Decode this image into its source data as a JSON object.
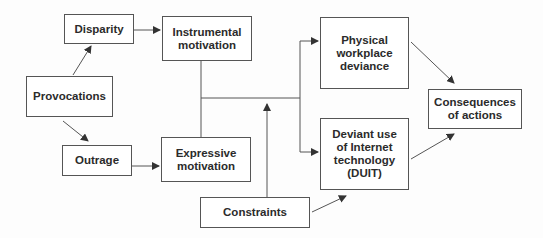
{
  "diagram": {
    "type": "flowchart",
    "colors": {
      "line": "#555555",
      "text": "#2b2b2b",
      "box_fill": "#ffffff"
    },
    "nodes": {
      "disparity": {
        "label": "Disparity"
      },
      "provocations": {
        "label": "Provocations"
      },
      "outrage": {
        "label": "Outrage"
      },
      "instrumental": {
        "label": "Instrumental motivation"
      },
      "expressive": {
        "label": "Expressive motivation"
      },
      "physical": {
        "label": "Physical workplace deviance"
      },
      "duit": {
        "label": "Deviant use of Internet technology (DUIT)"
      },
      "consequences": {
        "label": "Consequences of actions"
      },
      "constraints": {
        "label": "Constraints"
      }
    },
    "edges": [
      {
        "from": "provocations",
        "to": "disparity"
      },
      {
        "from": "provocations",
        "to": "outrage"
      },
      {
        "from": "disparity",
        "to": "instrumental"
      },
      {
        "from": "outrage",
        "to": "expressive"
      },
      {
        "from": "instrumental+expressive",
        "to": "physical"
      },
      {
        "from": "instrumental+expressive",
        "to": "duit"
      },
      {
        "from": "constraints",
        "to": "motivation-junction"
      },
      {
        "from": "constraints",
        "to": "duit"
      },
      {
        "from": "physical",
        "to": "consequences"
      },
      {
        "from": "duit",
        "to": "consequences"
      }
    ]
  }
}
